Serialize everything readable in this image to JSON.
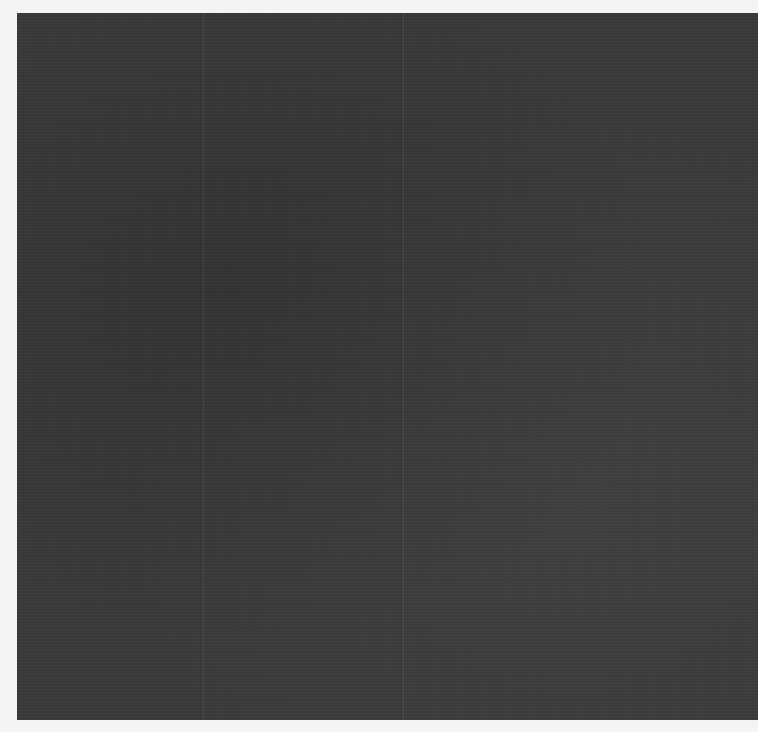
{
  "image": {
    "description": "Dark charcoal woven fabric texture on white background",
    "colors": {
      "fabric": "#3a3a3a",
      "background": "#f4f4f4"
    }
  }
}
